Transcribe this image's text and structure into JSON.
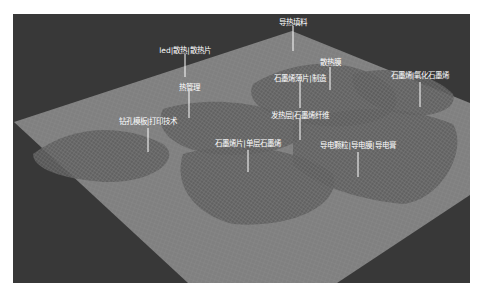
{
  "chart_data": {
    "type": "heatmap",
    "subtype": "3d-terrain-landscape",
    "title": "",
    "colors": {
      "background": "#383838",
      "plane": "#808080",
      "mesh": "#9a9a9a",
      "hill": "#5a5a5a",
      "label": "#ffffff"
    },
    "labels": [
      {
        "text": "导热填料",
        "u": 0.96,
        "v": 0.1,
        "height": 0.2
      },
      {
        "text": "led|散热|散热片",
        "u": 0.55,
        "v": 0.12,
        "height": 0.3
      },
      {
        "text": "散热膜",
        "u": 0.88,
        "v": 0.3,
        "height": 0.6
      },
      {
        "text": "热管理",
        "u": 0.45,
        "v": 0.28,
        "height": 0.5
      },
      {
        "text": "石墨烯薄片|制造",
        "u": 0.75,
        "v": 0.32,
        "height": 0.8
      },
      {
        "text": "石墨烯|氧化石墨烯",
        "u": 0.98,
        "v": 0.62,
        "height": 0.9
      },
      {
        "text": "钻孔模板|打印技术",
        "u": 0.3,
        "v": 0.35,
        "height": 0.4
      },
      {
        "text": "发热层|石墨烯纤维",
        "u": 0.65,
        "v": 0.45,
        "height": 0.7
      },
      {
        "text": "石墨烯片|单层石墨烯",
        "u": 0.48,
        "v": 0.55,
        "height": 0.8
      },
      {
        "text": "导电颗粒|导电膜|导电膏",
        "u": 0.72,
        "v": 0.7,
        "height": 0.9
      }
    ]
  }
}
